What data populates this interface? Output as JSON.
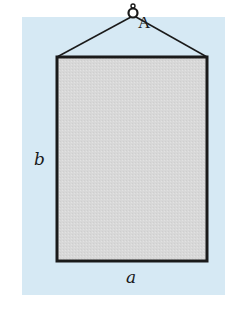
{
  "diagram": {
    "labels": {
      "point": "A",
      "width": "a",
      "height": "b"
    },
    "colors": {
      "background_panel": "#d6e9f4",
      "board_fill": "#d9d9d9",
      "stroke": "#1a1a1a"
    }
  }
}
